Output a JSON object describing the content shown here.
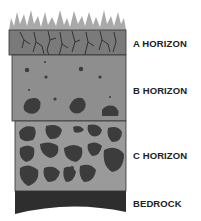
{
  "layers": [
    {
      "id": "a",
      "label": "A HORIZON",
      "color": "#7a7a7a"
    },
    {
      "id": "b",
      "label": "B HORIZON",
      "color": "#8e8e8e"
    },
    {
      "id": "c",
      "label": "C HORIZON",
      "color": "#9a9a9a"
    },
    {
      "id": "bedrock",
      "label": "BEDROCK",
      "color": "#2e2e2e"
    }
  ],
  "colors": {
    "grass": "#a9a9a9",
    "rock": "#3c3c3c",
    "roots": "#2a2a2a",
    "outline": "#333333"
  }
}
